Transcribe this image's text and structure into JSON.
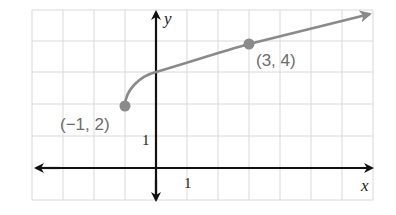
{
  "graph": {
    "x_axis_label": "x",
    "y_axis_label": "y",
    "x_tick_label": "1",
    "y_tick_label": "1",
    "points": [
      {
        "label": "(−1, 2)",
        "x": -1,
        "y": 2
      },
      {
        "label": "(3, 4)",
        "x": 3,
        "y": 4
      }
    ],
    "curve": "y = 2 + sqrt(x + 1)",
    "colors": {
      "curve": "#8a8a8a",
      "axes": "#111111",
      "grid": "#d9d9d9"
    }
  }
}
